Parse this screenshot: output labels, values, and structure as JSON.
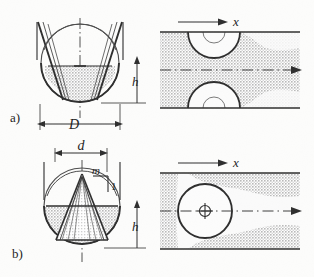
{
  "figure": {
    "background_color": "#fdfdfc",
    "ink_color": "#2b2b2b",
    "hatch_color": "#c9c9c9",
    "panels": [
      {
        "id": "a",
        "caption": "a)",
        "section_view": {
          "name": "parabolic-flume-section",
          "labels": [
            {
              "name": "diameter-label",
              "text": "D",
              "style": "italic"
            },
            {
              "name": "depth-label",
              "text": "h",
              "style": "italic"
            }
          ]
        },
        "plan_view": {
          "name": "parabolic-flume-plan",
          "labels": [
            {
              "name": "axis-label-x",
              "text": "x",
              "style": "italic"
            }
          ]
        }
      },
      {
        "id": "b",
        "caption": "b)",
        "section_view": {
          "name": "conical-plug-section",
          "labels": [
            {
              "name": "throat-diameter-label",
              "text": "d",
              "style": "italic"
            },
            {
              "name": "slope-numerator-label",
              "text": "m",
              "style": "italic"
            },
            {
              "name": "slope-denominator-label",
              "text": "1",
              "style": "upright"
            },
            {
              "name": "depth-label",
              "text": "h",
              "style": "italic"
            }
          ]
        },
        "plan_view": {
          "name": "conical-plug-plan",
          "labels": [
            {
              "name": "axis-label-x",
              "text": "x",
              "style": "italic"
            }
          ]
        }
      }
    ]
  }
}
